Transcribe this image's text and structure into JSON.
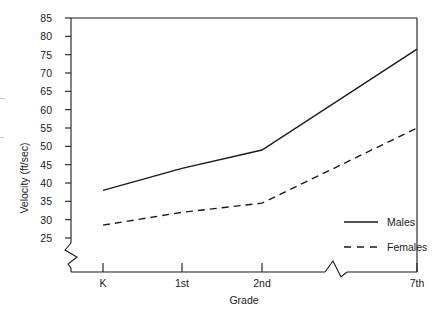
{
  "chart_data": {
    "type": "line",
    "title": "",
    "xlabel": "Grade",
    "ylabel": "Velocity (ft/sec)",
    "categories": [
      "K",
      "1st",
      "2nd",
      "7th"
    ],
    "x_tick_labels": [
      "K",
      "1st",
      "2nd",
      "7th"
    ],
    "y_tick_labels": [
      "25",
      "30",
      "35",
      "40",
      "45",
      "50",
      "55",
      "60",
      "65",
      "70",
      "75",
      "80",
      "85"
    ],
    "y_ticks": [
      25,
      30,
      35,
      40,
      45,
      50,
      55,
      60,
      65,
      70,
      75,
      80,
      85
    ],
    "ylim": [
      25,
      85
    ],
    "grid": false,
    "legend_position": "bottom-right",
    "axis_break": {
      "y_axis": true,
      "x_axis": true,
      "note": "zigzag break on y-axis below 25 and on x-axis between 2nd and 7th grade"
    },
    "series": [
      {
        "name": "Males",
        "style": "solid",
        "color": "#1a1a1a",
        "values": [
          38,
          44,
          49,
          76.5
        ]
      },
      {
        "name": "Females",
        "style": "dashed",
        "color": "#1a1a1a",
        "values": [
          28.5,
          32,
          34.5,
          55
        ]
      }
    ]
  },
  "legend": {
    "entries": [
      {
        "label": "Males",
        "style": "solid"
      },
      {
        "label": "Females",
        "style": "dashed"
      }
    ]
  },
  "axes": {
    "x_title": "Grade",
    "y_title": "Velocity (ft/sec)"
  }
}
